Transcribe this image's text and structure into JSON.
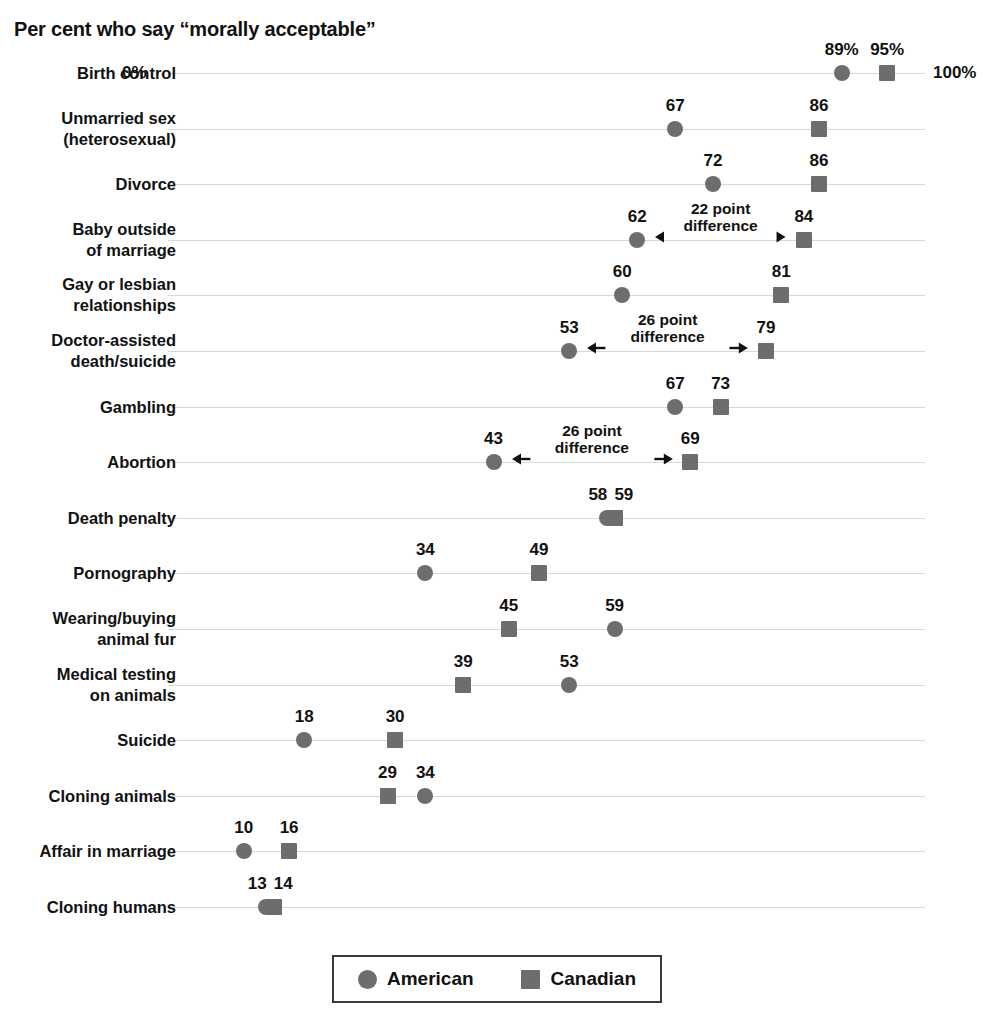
{
  "chart_data": {
    "type": "scatter",
    "title": "Per cent who say “morally acceptable”",
    "xlabel": "",
    "ylabel": "",
    "xlim": [
      0,
      100
    ],
    "axis_start_label": "0%",
    "axis_end_label": "100%",
    "grid": true,
    "legend_position": "bottom",
    "legend": [
      {
        "name": "American",
        "marker": "circle",
        "color": "#6d6d6d"
      },
      {
        "name": "Canadian",
        "marker": "square",
        "color": "#6d6d6d"
      }
    ],
    "categories": [
      "Birth control",
      "Unmarried sex\n(heterosexual)",
      "Divorce",
      "Baby outside\nof marriage",
      "Gay or lesbian\nrelationships",
      "Doctor-assisted\ndeath/suicide",
      "Gambling",
      "Abortion",
      "Death penalty",
      "Pornography",
      "Wearing/buying\nanimal fur",
      "Medical testing\non animals",
      "Suicide",
      "Cloning animals",
      "Affair in marriage",
      "Cloning humans"
    ],
    "series": [
      {
        "name": "American",
        "marker": "circle",
        "values": [
          89,
          67,
          72,
          62,
          60,
          53,
          67,
          43,
          58,
          34,
          59,
          53,
          18,
          34,
          10,
          13
        ],
        "value_labels": [
          "89%",
          "67",
          "72",
          "62",
          "60",
          "53",
          "67",
          "43",
          "58",
          "34",
          "59",
          "53",
          "18",
          "34",
          "10",
          "13"
        ]
      },
      {
        "name": "Canadian",
        "marker": "square",
        "values": [
          95,
          86,
          86,
          84,
          81,
          79,
          73,
          69,
          59,
          49,
          45,
          39,
          30,
          29,
          16,
          14
        ],
        "value_labels": [
          "95%",
          "86",
          "86",
          "84",
          "81",
          "79",
          "73",
          "69",
          "59",
          "49",
          "45",
          "39",
          "30",
          "29",
          "16",
          "14"
        ]
      }
    ],
    "annotations": [
      {
        "category": "Baby outside\nof marriage",
        "row": 3,
        "line1": "22 point",
        "line2": "difference",
        "from": 62,
        "to": 84
      },
      {
        "category": "Doctor-assisted\ndeath/suicide",
        "row": 5,
        "line1": "26 point",
        "line2": "difference",
        "from": 53,
        "to": 79
      },
      {
        "category": "Abortion",
        "row": 7,
        "line1": "26 point",
        "line2": "difference",
        "from": 43,
        "to": 69
      }
    ],
    "colors": {
      "marker": "#6d6d6d",
      "gridline": "#d8d8d8",
      "text": "#111111",
      "legend_border": "#3a3a3a",
      "background": "#ffffff"
    }
  }
}
